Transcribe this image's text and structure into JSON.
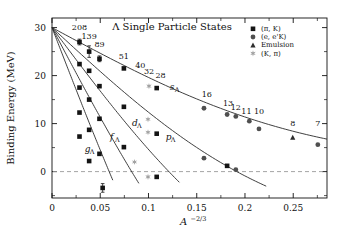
{
  "chart_data": {
    "type": "scatter",
    "title": "Λ Single Particle States",
    "xlabel": "A−2/3",
    "xlabel_base": "A",
    "xlabel_exp": "−2/3",
    "ylabel": "Binding Energy (MeV)",
    "xlim": [
      0,
      0.285
    ],
    "ylim": [
      -5.5,
      32
    ],
    "xticks": [
      0,
      0.05,
      0.1,
      0.15,
      0.2,
      0.25
    ],
    "xtick_labels": [
      "0",
      "0.05",
      "0.1",
      "0.15",
      "0.2",
      "0.25"
    ],
    "yticks": [
      0,
      10,
      20,
      30
    ],
    "ytick_labels": [
      "0",
      "10",
      "20",
      "30"
    ],
    "grid": false,
    "zero_line": 0,
    "legend_position": "top-right",
    "legend": [
      {
        "label": "(π, K)",
        "marker": "square",
        "color": "#111111"
      },
      {
        "label": "(e, e'K)",
        "marker": "circle",
        "color": "#555555"
      },
      {
        "label": "Emulsion",
        "marker": "triangle",
        "color": "#333333"
      },
      {
        "label": "(K, π)",
        "marker": "star",
        "color": "#9a9a9a"
      }
    ],
    "curve_labels": [
      {
        "text": "sΛ",
        "x": 0.122,
        "y": 17.1
      },
      {
        "text": "pΛ",
        "x": 0.118,
        "y": 6.6
      },
      {
        "text": "dΛ",
        "x": 0.083,
        "y": 9.6
      },
      {
        "text": "fΛ",
        "x": 0.06,
        "y": 6.6
      },
      {
        "text": "gΛ",
        "x": 0.034,
        "y": 4.1
      }
    ],
    "point_labels": [
      {
        "text": "208",
        "x": 0.0285,
        "y": 29.6
      },
      {
        "text": "139",
        "x": 0.0385,
        "y": 27.6
      },
      {
        "text": "89",
        "x": 0.0492,
        "y": 26.0
      },
      {
        "text": "51",
        "x": 0.0745,
        "y": 23.5
      },
      {
        "text": "40",
        "x": 0.0915,
        "y": 21.5
      },
      {
        "text": "32",
        "x": 0.1005,
        "y": 20.4
      },
      {
        "text": "28",
        "x": 0.1125,
        "y": 19.6
      },
      {
        "text": "16",
        "x": 0.1605,
        "y": 15.6
      },
      {
        "text": "13",
        "x": 0.1825,
        "y": 13.6
      },
      {
        "text": "12",
        "x": 0.1905,
        "y": 12.8
      },
      {
        "text": "11",
        "x": 0.2015,
        "y": 12.1
      },
      {
        "text": "10",
        "x": 0.2145,
        "y": 12.1
      },
      {
        "text": "8",
        "x": 0.2495,
        "y": 9.4
      },
      {
        "text": "7",
        "x": 0.2755,
        "y": 9.4
      }
    ],
    "series": [
      {
        "name": "sΛ",
        "curve": {
          "y0": 30.0,
          "a": 108.0,
          "b": 120.0,
          "xmax": 0.285
        },
        "points": [
          {
            "x": 0.0285,
            "y": 27.0,
            "marker": "square",
            "err": 0.6
          },
          {
            "x": 0.0385,
            "y": 25.0,
            "marker": "square",
            "err": 1.2
          },
          {
            "x": 0.0492,
            "y": 23.5,
            "marker": "square",
            "err": 0.6
          },
          {
            "x": 0.0745,
            "y": 21.5,
            "marker": "square",
            "err": 0.4
          },
          {
            "x": 0.1005,
            "y": 17.8,
            "marker": "star",
            "err": 0.5
          },
          {
            "x": 0.1085,
            "y": 17.4,
            "marker": "square",
            "err": 0.4
          },
          {
            "x": 0.1575,
            "y": 13.2,
            "marker": "circle",
            "err": 0.4
          },
          {
            "x": 0.1815,
            "y": 11.9,
            "marker": "circle",
            "err": 0.4
          },
          {
            "x": 0.1905,
            "y": 11.5,
            "marker": "circle",
            "err": 0.4
          },
          {
            "x": 0.2045,
            "y": 10.5,
            "marker": "circle",
            "err": 0.4
          },
          {
            "x": 0.2145,
            "y": 8.9,
            "marker": "circle",
            "err": 0.4
          },
          {
            "x": 0.2495,
            "y": 7.1,
            "marker": "triangle",
            "err": 0.4
          },
          {
            "x": 0.2755,
            "y": 5.6,
            "marker": "circle",
            "err": 0.5
          }
        ]
      },
      {
        "name": "pΛ",
        "curve": {
          "y0": 30.0,
          "a": 185.0,
          "b": 148.0,
          "xmax": 0.222
        },
        "points": [
          {
            "x": 0.0285,
            "y": 22.4,
            "marker": "square",
            "err": 0.5
          },
          {
            "x": 0.0385,
            "y": 21.0,
            "marker": "square",
            "err": 0.5
          },
          {
            "x": 0.0492,
            "y": 17.8,
            "marker": "square",
            "err": 0.5
          },
          {
            "x": 0.0745,
            "y": 13.5,
            "marker": "square",
            "err": 0.5
          },
          {
            "x": 0.0995,
            "y": 10.9,
            "marker": "star",
            "err": 0.5
          },
          {
            "x": 0.0995,
            "y": 8.2,
            "marker": "star",
            "err": 0.5
          },
          {
            "x": 0.1085,
            "y": 7.9,
            "marker": "square",
            "err": 0.5
          },
          {
            "x": 0.1575,
            "y": 2.8,
            "marker": "circle",
            "err": 0.5
          },
          {
            "x": 0.1815,
            "y": 1.2,
            "marker": "square",
            "err": 0.5
          },
          {
            "x": 0.1905,
            "y": 0.4,
            "marker": "circle",
            "err": 0.5
          }
        ]
      },
      {
        "name": "dΛ",
        "curve": {
          "y0": 30.0,
          "a": 268.0,
          "b": 168.0,
          "xmax": 0.132
        },
        "points": [
          {
            "x": 0.0285,
            "y": 17.5,
            "marker": "square",
            "err": 0.5
          },
          {
            "x": 0.0385,
            "y": 15.0,
            "marker": "square",
            "err": 0.5
          },
          {
            "x": 0.0492,
            "y": 11.0,
            "marker": "square",
            "err": 0.5
          },
          {
            "x": 0.0745,
            "y": 5.1,
            "marker": "square",
            "err": 0.5
          },
          {
            "x": 0.0855,
            "y": 2.0,
            "marker": "star",
            "err": 0.5
          },
          {
            "x": 0.0995,
            "y": -1.1,
            "marker": "star",
            "err": 0.5
          },
          {
            "x": 0.1085,
            "y": -1.1,
            "marker": "square",
            "err": 0.5
          }
        ]
      },
      {
        "name": "fΛ",
        "curve": {
          "y0": 30.0,
          "a": 380.0,
          "b": 200.0,
          "xmax": 0.09
        },
        "points": [
          {
            "x": 0.0285,
            "y": 12.3,
            "marker": "square",
            "err": 0.5
          },
          {
            "x": 0.0385,
            "y": 8.7,
            "marker": "square",
            "err": 0.5
          },
          {
            "x": 0.0492,
            "y": 3.7,
            "marker": "square",
            "err": 0.5
          },
          {
            "x": 0.0525,
            "y": -3.4,
            "marker": "square",
            "err": 0.9
          }
        ]
      },
      {
        "name": "gΛ",
        "curve": {
          "y0": 30.0,
          "a": 520.0,
          "b": 230.0,
          "xmax": 0.063
        },
        "points": [
          {
            "x": 0.0285,
            "y": 7.3,
            "marker": "square",
            "err": 0.5
          },
          {
            "x": 0.0385,
            "y": 2.2,
            "marker": "square",
            "err": 0.5
          }
        ]
      }
    ]
  }
}
